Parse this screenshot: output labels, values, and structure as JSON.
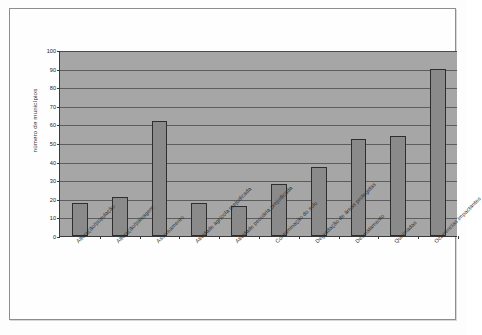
{
  "figure": {
    "background_color": "#fefefe",
    "frame_color": "#8d8d8d"
  },
  "chart_data": {
    "type": "bar",
    "title": "",
    "xlabel": "",
    "ylabel": "número de municípios",
    "ylim": [
      0,
      100
    ],
    "ytick_step": 10,
    "yticks": [
      0,
      10,
      20,
      30,
      40,
      50,
      60,
      70,
      80,
      90,
      100
    ],
    "ytick_labels": [
      "0",
      "10",
      "20",
      "30",
      "40",
      "50",
      "60",
      "70",
      "80",
      "90",
      "100"
    ],
    "grid": true,
    "legend": null,
    "legend_position": "none",
    "plot_background_color": "#a6a6a6",
    "bar_color": "#8a8a8a",
    "bar_edge_color": "#2e2e2e",
    "categories": [
      "Alteração/população",
      "Alteração/paisagem",
      "Assoreamento",
      "Atividade agrícola prejudicada",
      "Atividade pecuária prejudicada",
      "Contaminação do solo",
      "Degradação de áreas protegidas",
      "Desmatamento",
      "Queimadas",
      "Ocorrências impactantes"
    ],
    "values": [
      18,
      21,
      62,
      18,
      16,
      28,
      37,
      52,
      54,
      90
    ]
  }
}
